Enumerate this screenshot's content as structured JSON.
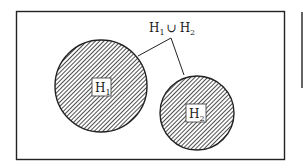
{
  "diagram": {
    "type": "venn",
    "union_label": {
      "left": "H",
      "left_sub": "1",
      "operator": "∪",
      "right": "H",
      "right_sub": "2"
    },
    "sets": [
      {
        "name": "H",
        "sub": "1",
        "cx": 101,
        "cy": 86,
        "r": 46
      },
      {
        "name": "H",
        "sub": "2",
        "cx": 197,
        "cy": 113,
        "r": 37
      }
    ],
    "colors": {
      "stroke": "#222222",
      "hatch": "#3a3a3a",
      "background": "#ffffff"
    }
  }
}
